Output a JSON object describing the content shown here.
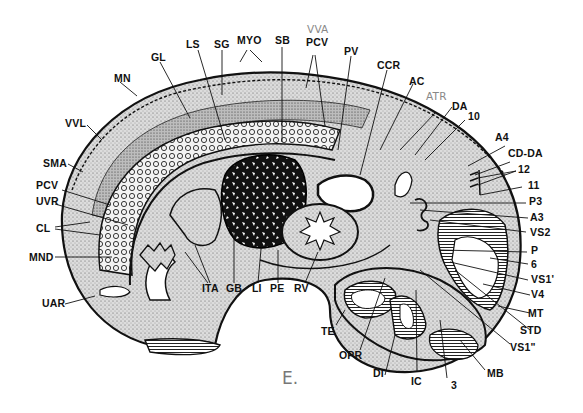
{
  "figure": {
    "caption": "E.",
    "colors": {
      "outline": "#111111",
      "stipple_fill": "#d8d8d8",
      "dark_tissue": "#1a1a1a",
      "background": "#ffffff",
      "gray_label": "#888888"
    }
  },
  "labels": {
    "top": [
      {
        "id": "GL",
        "text": "GL"
      },
      {
        "id": "LS",
        "text": "LS"
      },
      {
        "id": "SG",
        "text": "SG"
      },
      {
        "id": "MYO",
        "text": "MYO"
      },
      {
        "id": "SB",
        "text": "SB"
      },
      {
        "id": "VVA",
        "text": "VVA",
        "style": "gray"
      },
      {
        "id": "PCV_top",
        "text": "PCV"
      },
      {
        "id": "PV",
        "text": "PV"
      },
      {
        "id": "CCR",
        "text": "CCR"
      },
      {
        "id": "AC",
        "text": "AC"
      },
      {
        "id": "ATR",
        "text": "ATR",
        "style": "gray"
      },
      {
        "id": "DA",
        "text": "DA"
      },
      {
        "id": "10",
        "text": "10"
      }
    ],
    "left": [
      {
        "id": "MN",
        "text": "MN"
      },
      {
        "id": "VVL",
        "text": "VVL"
      },
      {
        "id": "SMA",
        "text": "SMA"
      },
      {
        "id": "PCV_left",
        "text": "PCV"
      },
      {
        "id": "UVR",
        "text": "UVR"
      },
      {
        "id": "CL",
        "text": "CL"
      },
      {
        "id": "MND",
        "text": "MND"
      },
      {
        "id": "UAR",
        "text": "UAR"
      }
    ],
    "right": [
      {
        "id": "A4",
        "text": "A4"
      },
      {
        "id": "CD-DA",
        "text": "CD-DA"
      },
      {
        "id": "12",
        "text": "12"
      },
      {
        "id": "11",
        "text": "11"
      },
      {
        "id": "P3",
        "text": "P3"
      },
      {
        "id": "A3",
        "text": "A3"
      },
      {
        "id": "VS2",
        "text": "VS2"
      },
      {
        "id": "P",
        "text": "P"
      },
      {
        "id": "6",
        "text": "6"
      },
      {
        "id": "VS1p",
        "text": "VS1'"
      },
      {
        "id": "V4",
        "text": "V4"
      },
      {
        "id": "MT",
        "text": "MT"
      },
      {
        "id": "STD",
        "text": "STD"
      },
      {
        "id": "VS1pp",
        "text": "VS1\""
      }
    ],
    "bottom": [
      {
        "id": "ITA",
        "text": "ITA"
      },
      {
        "id": "GB",
        "text": "GB"
      },
      {
        "id": "LI",
        "text": "LI"
      },
      {
        "id": "PE",
        "text": "PE"
      },
      {
        "id": "RV",
        "text": "RV"
      },
      {
        "id": "TE",
        "text": "TE"
      },
      {
        "id": "OPR",
        "text": "OPR"
      },
      {
        "id": "DI",
        "text": "DI"
      },
      {
        "id": "IC",
        "text": "IC"
      },
      {
        "id": "3",
        "text": "3"
      },
      {
        "id": "MB",
        "text": "MB"
      }
    ]
  }
}
